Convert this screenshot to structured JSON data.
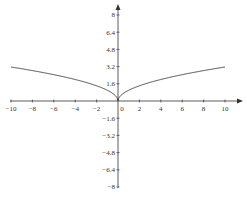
{
  "chart_data": {
    "type": "line",
    "title": "",
    "xlabel": "",
    "ylabel": "",
    "function": "y = sqrt(|x|)",
    "xlim": [
      -10,
      10
    ],
    "ylim": [
      -8,
      8
    ],
    "grid": false,
    "x_ticks": [
      "-10",
      "-8",
      "-6",
      "-4",
      "-2",
      "0",
      "2",
      "4",
      "6",
      "8",
      "10"
    ],
    "y_ticks": [
      "8",
      "6.4",
      "4.8",
      "3.2",
      "1.6",
      "-1.6",
      "-3.2",
      "-4.8",
      "-6.4",
      "-8"
    ],
    "series": [
      {
        "name": "curve",
        "x": [
          -10,
          -8,
          -6,
          -4,
          -2,
          -1,
          -0.5,
          0,
          0.5,
          1,
          2,
          4,
          6,
          8,
          10
        ],
        "y": [
          3.16,
          2.83,
          2.45,
          2.0,
          1.41,
          1.0,
          0.71,
          0,
          0.71,
          1.0,
          1.41,
          2.0,
          2.45,
          2.83,
          3.16
        ]
      }
    ]
  },
  "colors": {
    "axis": "#333333",
    "curve": "#333333"
  }
}
